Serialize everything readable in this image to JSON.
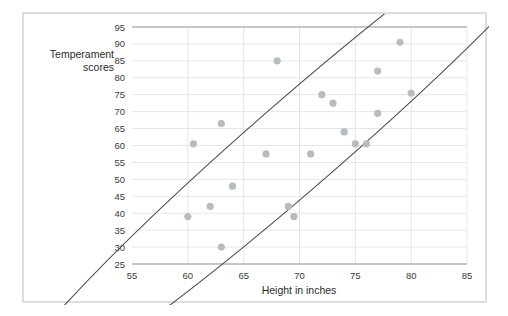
{
  "chart_data": {
    "type": "scatter",
    "title": "",
    "xlabel": "Height in inches",
    "ylabel": "Temperament scores",
    "xlim": [
      55,
      85
    ],
    "ylim": [
      25,
      95
    ],
    "xticks": [
      55,
      60,
      65,
      70,
      75,
      80,
      85
    ],
    "yticks": [
      25,
      30,
      35,
      40,
      45,
      50,
      55,
      60,
      65,
      70,
      75,
      80,
      85,
      90,
      95
    ],
    "grid": true,
    "legend": "none",
    "point_color": "#b6bcc0",
    "outline_color": "#4a4f55",
    "grid_color": "#e3e6e8",
    "axis_color": "#c4c7c9",
    "annotations": [
      {
        "name": "correlation-ellipse",
        "shape": "ellipse",
        "center_x": 70,
        "center_y": 61,
        "semi_major": 36,
        "semi_minor": 13,
        "rotation_deg": -41
      }
    ],
    "points": [
      {
        "x": 60.0,
        "y": 39.0
      },
      {
        "x": 62.0,
        "y": 42.0
      },
      {
        "x": 63.0,
        "y": 30.0
      },
      {
        "x": 64.0,
        "y": 48.0
      },
      {
        "x": 60.5,
        "y": 60.5
      },
      {
        "x": 63.0,
        "y": 66.5
      },
      {
        "x": 67.0,
        "y": 57.5
      },
      {
        "x": 68.0,
        "y": 85.0
      },
      {
        "x": 69.0,
        "y": 42.0
      },
      {
        "x": 69.5,
        "y": 39.0
      },
      {
        "x": 71.0,
        "y": 57.5
      },
      {
        "x": 72.0,
        "y": 75.0
      },
      {
        "x": 73.0,
        "y": 72.5
      },
      {
        "x": 74.0,
        "y": 64.0
      },
      {
        "x": 75.0,
        "y": 60.5
      },
      {
        "x": 76.0,
        "y": 60.5
      },
      {
        "x": 77.0,
        "y": 69.5
      },
      {
        "x": 77.0,
        "y": 82.0
      },
      {
        "x": 79.0,
        "y": 90.5
      },
      {
        "x": 80.0,
        "y": 75.5
      }
    ]
  },
  "axis_titles": {
    "y_line1": "Temperament",
    "y_line2": "scores",
    "x": "Height in inches"
  }
}
